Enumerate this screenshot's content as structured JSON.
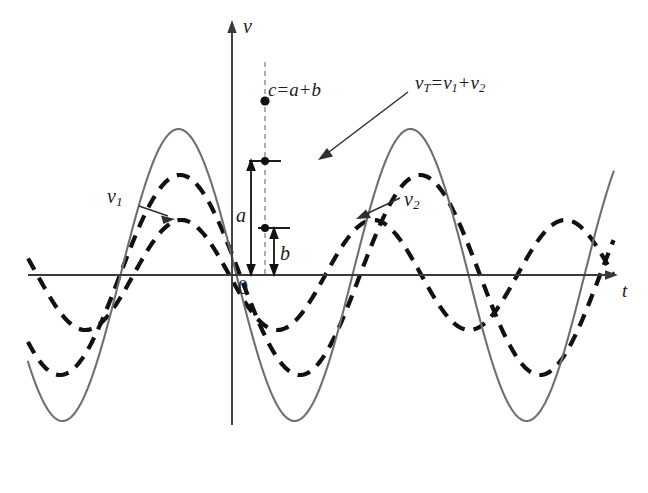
{
  "figure": {
    "caption": "",
    "background_color": "#ffffff",
    "axes": {
      "x_axis": {
        "label": "t",
        "label_name": "t-axis-label",
        "color": "#3a3a3a",
        "y_pixel": 275,
        "x_start": 28,
        "x_end": 618,
        "arrow": "right"
      },
      "y_axis": {
        "label": "v",
        "label_name": "v-axis-label",
        "color": "#3a3a3a",
        "x_pixel": 232,
        "y_start": 20,
        "y_end": 425,
        "arrow": "up"
      },
      "origin_label": "0"
    },
    "labels": {
      "sum_peak": {
        "text": "c = a + b",
        "c": "c",
        "eq": "=",
        "a": "a",
        "plus": "+",
        "b": "b"
      },
      "total_curve": {
        "v": "v",
        "sub_T": "T",
        "eq": "=",
        "v1": "v",
        "sub_1": "1",
        "plus": "+",
        "v2": "v",
        "sub_2": "2"
      },
      "curve_v1": {
        "v": "v",
        "sub": "1"
      },
      "curve_v2": {
        "v": "v",
        "sub": "2"
      },
      "amplitude_a": "a",
      "amplitude_b": "b"
    },
    "colors": {
      "axis": "#3a3a3a",
      "sum_curve": "#6f6f6f",
      "component_curve": "#111111",
      "annotation": "#1c1c1c",
      "dashed_guide": "#8a8a8a"
    }
  },
  "chart_data": {
    "type": "line",
    "title": "",
    "subtitle": "",
    "xlabel": "t",
    "ylabel": "v",
    "grid": false,
    "legend": "inline-annotations",
    "axis_origin_label": "0",
    "xlim": [
      -204,
      386
    ],
    "ylim": [
      -160,
      160
    ],
    "annotations": [
      {
        "name": "sum-peak-label",
        "text": "c = a + b",
        "x": 33,
        "y": 174,
        "note": "peak of vT at the dashed reference ordinate"
      },
      {
        "name": "total-curve-label",
        "text": "vT = v1 + v2",
        "x": 183,
        "y": 185
      },
      {
        "name": "v1-label",
        "text": "v1",
        "x": -125,
        "y": 74
      },
      {
        "name": "v2-label",
        "text": "v2",
        "x": 172,
        "y": 71
      },
      {
        "name": "a-arrow-label",
        "text": "a",
        "x": 4,
        "y": 48,
        "measures": "ordinate of v1 at reference time"
      },
      {
        "name": "b-arrow-label",
        "text": "b",
        "x": 48,
        "y": 16,
        "measures": "ordinate of v2 at reference time"
      },
      {
        "name": "reference-ordinate",
        "text": "dashed vertical guide",
        "x": 33
      }
    ],
    "series": [
      {
        "name": "v1",
        "style": "dashed",
        "color": "#111111",
        "amplitude": 100,
        "period": 240,
        "phase_deg": 168,
        "description": "larger dashed sinusoid, peaks just left of the v axis"
      },
      {
        "name": "v2",
        "style": "dashed",
        "color": "#111111",
        "amplitude": 55,
        "period": 192,
        "phase_deg": 185,
        "description": "smaller dashed sinusoid, peaks to the right of the v axis"
      },
      {
        "name": "vT",
        "style": "solid",
        "color": "#6f6f6f",
        "amplitude": 146,
        "period": 232,
        "phase_deg": 173,
        "description": "solid grey curve, point-by-point sum of v1 and v2"
      }
    ]
  }
}
